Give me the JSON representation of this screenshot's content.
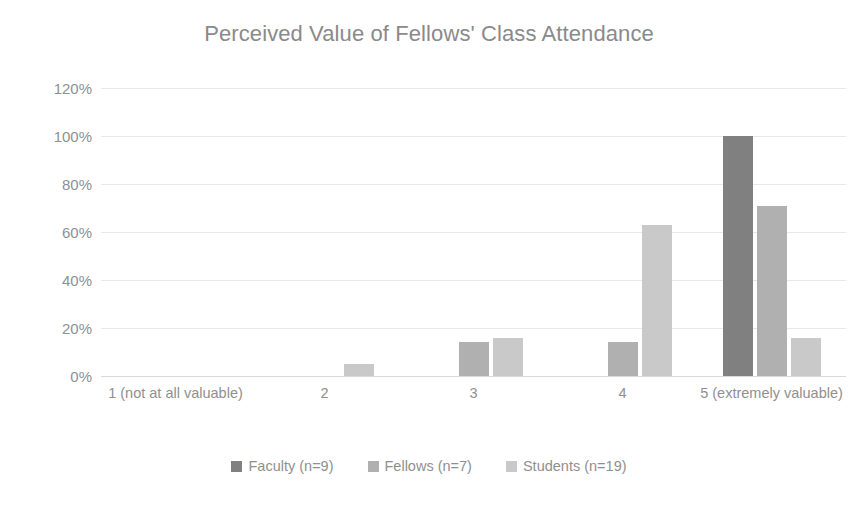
{
  "chart_data": {
    "type": "bar",
    "title": "Perceived Value of Fellows' Class Attendance",
    "xlabel": "",
    "ylabel": "",
    "ylim": [
      0,
      120
    ],
    "grid": true,
    "legend_position": "bottom",
    "categories": [
      "1 (not at all valuable)",
      "2",
      "3",
      "4",
      "5 (extremely valuable)"
    ],
    "y_ticks": [
      "0%",
      "20%",
      "40%",
      "60%",
      "80%",
      "100%",
      "120%"
    ],
    "y_tick_values": [
      0,
      20,
      40,
      60,
      80,
      100,
      120
    ],
    "series": [
      {
        "name": "Faculty (n=9)",
        "color": "#808080",
        "values": [
          0,
          0,
          0,
          0,
          100
        ]
      },
      {
        "name": "Fellows (n=7)",
        "color": "#b0b0b0",
        "values": [
          0,
          0,
          14,
          14,
          71
        ]
      },
      {
        "name": "Students (n=19)",
        "color": "#c9c9c9",
        "values": [
          0,
          5,
          16,
          63,
          16
        ]
      }
    ]
  }
}
